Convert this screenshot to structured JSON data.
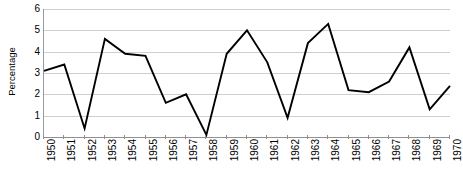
{
  "chart_data": {
    "type": "line",
    "title": "",
    "xlabel": "",
    "ylabel": "Percentage",
    "categories": [
      "1950",
      "1951",
      "1952",
      "1953",
      "1954",
      "1955",
      "1956",
      "1957",
      "1958",
      "1959",
      "1960",
      "1961",
      "1962",
      "1963",
      "1964",
      "1965",
      "1966",
      "1967",
      "1968",
      "1969",
      "1970"
    ],
    "values": [
      3.1,
      3.4,
      0.4,
      4.6,
      3.9,
      3.8,
      1.6,
      2.0,
      0.1,
      3.9,
      5.0,
      3.5,
      0.9,
      4.4,
      5.3,
      2.2,
      2.1,
      2.6,
      4.2,
      1.3,
      2.4
    ],
    "ylim": [
      0,
      6
    ],
    "yticks": [
      0,
      1,
      2,
      3,
      4,
      5,
      6
    ],
    "ytick_labels": [
      "0",
      "1",
      "2",
      "3",
      "4",
      "5",
      "6"
    ],
    "grid": true,
    "legend": false,
    "series_color": "#000000",
    "grid_color": "#cfcfcf",
    "axis_color": "#8f8f8f"
  }
}
